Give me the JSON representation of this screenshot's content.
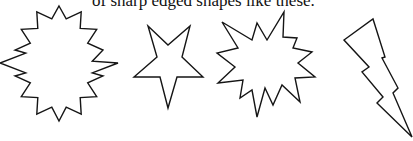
{
  "document": {
    "caption": "of sharp edged shapes like these."
  },
  "shapes": [
    {
      "name": "starburst",
      "label": "16-point starburst"
    },
    {
      "name": "star",
      "label": "5-point star (inverted)"
    },
    {
      "name": "explosion",
      "label": "irregular explosion burst"
    },
    {
      "name": "lightning-bolt",
      "label": "lightning bolt"
    }
  ],
  "colors": {
    "stroke": "#151515",
    "fill": "#ffffff",
    "background": "#ffffff"
  }
}
